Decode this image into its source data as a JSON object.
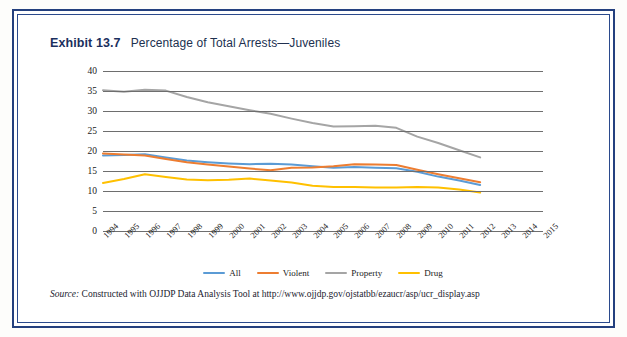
{
  "frame": {
    "border_color": "#24407e"
  },
  "header": {
    "exhibit_label": "Exhibit 13.7",
    "title": "Percentage of Total Arrests—Juveniles"
  },
  "source": {
    "prefix": "Source:",
    "text": " Constructed with OJJDP Data Analysis Tool at http://www.ojjdp.gov/ojstatbb/ezaucr/asp/ucr_display.asp"
  },
  "chart_data": {
    "type": "line",
    "title": "Percentage of Total Arrests—Juveniles",
    "xlabel": "",
    "ylabel": "",
    "ylim": [
      0,
      40
    ],
    "yticks": [
      0,
      5,
      10,
      15,
      20,
      25,
      30,
      35,
      40
    ],
    "grid": true,
    "legend_position": "bottom",
    "x": [
      "1994",
      "1995",
      "1996",
      "1997",
      "1998",
      "1999",
      "2000",
      "2001",
      "2002",
      "2003",
      "2004",
      "2005",
      "2006",
      "2007",
      "2008",
      "2009",
      "2010",
      "2011",
      "2012",
      "2013",
      "2014",
      "2015"
    ],
    "categories": [
      "1994",
      "1995",
      "1996",
      "1997",
      "1998",
      "1999",
      "2000",
      "2001",
      "2002",
      "2003",
      "2004",
      "2005",
      "2006",
      "2007",
      "2008",
      "2009",
      "2010",
      "2011",
      "2012",
      "2013",
      "2014",
      "2015"
    ],
    "series": [
      {
        "name": "All",
        "color": "#5B9BD5",
        "values": [
          18.9,
          19.0,
          19.2,
          18.4,
          17.6,
          17.2,
          16.9,
          16.7,
          16.8,
          16.6,
          16.2,
          15.8,
          16.0,
          15.8,
          15.7,
          14.8,
          13.6,
          12.6,
          11.5,
          null,
          null,
          null
        ]
      },
      {
        "name": "Violent",
        "color": "#ED7D31",
        "values": [
          19.4,
          19.1,
          18.9,
          18.0,
          17.2,
          16.6,
          16.1,
          15.6,
          15.2,
          15.8,
          15.9,
          16.2,
          16.7,
          16.6,
          16.5,
          15.3,
          14.2,
          13.2,
          12.2,
          null,
          null,
          null
        ]
      },
      {
        "name": "Property",
        "color": "#A5A5A5",
        "values": [
          35.2,
          34.8,
          35.3,
          35.1,
          33.5,
          32.2,
          31.2,
          30.2,
          29.3,
          28.1,
          27.0,
          26.1,
          26.2,
          26.3,
          25.8,
          23.6,
          22.0,
          20.2,
          18.4,
          null,
          null,
          null
        ]
      },
      {
        "name": "Drug",
        "color": "#FFC000",
        "values": [
          12.0,
          13.0,
          14.2,
          13.5,
          12.9,
          12.7,
          12.8,
          13.1,
          12.6,
          12.1,
          11.3,
          11.0,
          11.0,
          10.9,
          10.9,
          11.0,
          10.9,
          10.4,
          9.6,
          null,
          null,
          null
        ]
      }
    ],
    "legend": [
      {
        "label": "All",
        "color": "#5B9BD5"
      },
      {
        "label": "Violent",
        "color": "#ED7D31"
      },
      {
        "label": "Property",
        "color": "#A5A5A5"
      },
      {
        "label": "Drug",
        "color": "#FFC000"
      }
    ]
  }
}
